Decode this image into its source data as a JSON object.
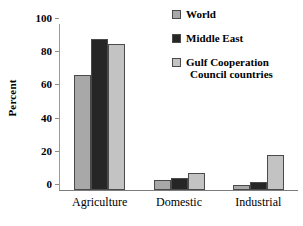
{
  "chart_data": {
    "type": "bar",
    "title": "",
    "xlabel": "",
    "ylabel": "Percent",
    "ylim": [
      0,
      100
    ],
    "yticks": [
      0,
      20,
      40,
      60,
      80,
      100
    ],
    "ytick_labels": [
      "0",
      "20",
      "40",
      "60",
      "80",
      "100"
    ],
    "grid": false,
    "legend_position": "upper-right",
    "categories": [
      "Agriculture",
      "Domestic",
      "Industrial"
    ],
    "series": [
      {
        "name": "World",
        "color": "#a8a8a8",
        "values": [
          69,
          6,
          3
        ]
      },
      {
        "name": "Middle East",
        "color": "#262626",
        "values": [
          91,
          7,
          5
        ]
      },
      {
        "name": "Gulf Cooperation Council countries",
        "color": "#c3c3c3",
        "values": [
          88,
          10,
          21
        ]
      }
    ]
  },
  "legend": {
    "entries": [
      {
        "label": "World",
        "line2": ""
      },
      {
        "label": "Middle East",
        "line2": ""
      },
      {
        "label": "Gulf Cooperation",
        "line2": "Council countries"
      }
    ]
  },
  "colors": {
    "world": "#a8a8a8",
    "middle_east": "#262626",
    "gcc": "#c3c3c3",
    "axis": "#7d7d7d",
    "bar_outline": "#4a4a4a",
    "text": "#000000",
    "background": "#ffffff"
  }
}
